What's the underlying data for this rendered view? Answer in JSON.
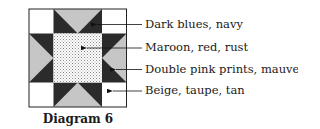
{
  "caption": "Diagram 6",
  "colors": {
    "dark": "#2b2b2b",
    "light_gray": "#c6c6c6",
    "background": "#ffffff",
    "dot": "#8a8a8a",
    "outline": "#222222"
  },
  "legend": [
    {
      "label": "Dark blues, navy",
      "target": "star-points"
    },
    {
      "label": "Maroon, red, rust",
      "target": "center-square"
    },
    {
      "label": "Double pink prints, mauve",
      "target": "edge-triangles"
    },
    {
      "label": "Beige, taupe, tan",
      "target": "corner-squares"
    }
  ]
}
